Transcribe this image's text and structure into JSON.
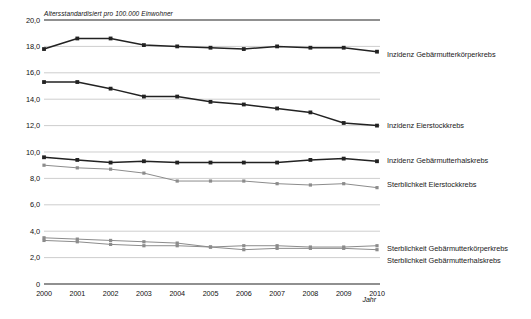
{
  "chart_data": {
    "type": "line",
    "title": "",
    "subtitle": "Altersstandardisiert pro 100.000 Einwohner",
    "xlabel": "Jahr",
    "ylabel": "",
    "x": [
      2000,
      2001,
      2002,
      2003,
      2004,
      2005,
      2006,
      2007,
      2008,
      2009,
      2010
    ],
    "categories": [
      "2000",
      "2001",
      "2002",
      "2003",
      "2004",
      "2005",
      "2006",
      "2007",
      "2008",
      "2009",
      "2010"
    ],
    "ylim": [
      0,
      20
    ],
    "yticks": [
      "0",
      "2,0",
      "4,0",
      "6,0",
      "8,0",
      "10,0",
      "12,0",
      "14,0",
      "16,0",
      "18,0",
      "20,0"
    ],
    "ytick_values": [
      0,
      2,
      4,
      6,
      8,
      10,
      12,
      14,
      16,
      18,
      20
    ],
    "grid": true,
    "legend_position": "right",
    "series": [
      {
        "name": "Inzidenz Gebärmutterkörperkrebs",
        "color": "#222222",
        "values": [
          17.8,
          18.6,
          18.6,
          18.1,
          18.0,
          17.9,
          17.8,
          18.0,
          17.9,
          17.9,
          17.6
        ]
      },
      {
        "name": "Inzidenz Eierstockkrebs",
        "color": "#222222",
        "values": [
          15.3,
          15.3,
          14.8,
          14.2,
          14.2,
          13.8,
          13.6,
          13.3,
          13.0,
          12.2,
          12.0
        ]
      },
      {
        "name": "Inzidenz Gebärmutterhalskrebs",
        "color": "#222222",
        "values": [
          9.6,
          9.4,
          9.2,
          9.3,
          9.2,
          9.2,
          9.2,
          9.2,
          9.4,
          9.5,
          9.3
        ]
      },
      {
        "name": "Sterblichkeit Eierstockkrebs",
        "color": "#8c8c8c",
        "values": [
          9.0,
          8.8,
          8.7,
          8.4,
          7.8,
          7.8,
          7.8,
          7.6,
          7.5,
          7.6,
          7.3
        ]
      },
      {
        "name": "Sterblichkeit Gebärmutterkörperkrebs",
        "color": "#8c8c8c",
        "values": [
          3.5,
          3.4,
          3.3,
          3.2,
          3.1,
          2.8,
          2.9,
          2.9,
          2.8,
          2.8,
          2.9
        ]
      },
      {
        "name": "Sterblichkeit Gebärmutterhalskrebs",
        "color": "#8c8c8c",
        "values": [
          3.3,
          3.2,
          3.0,
          2.9,
          2.9,
          2.8,
          2.6,
          2.7,
          2.7,
          2.7,
          2.6
        ]
      }
    ]
  },
  "axis": {
    "subtitle": "Altersstandardisiert pro 100.000 Einwohner",
    "x_title": "Jahr"
  },
  "legend": {
    "items": [
      {
        "label": "Inzidenz Gebärmutterkörperkrebs",
        "y": 57
      },
      {
        "label": "Inzidenz Eierstockkrebs",
        "y": 128
      },
      {
        "label": "Inzidenz Gebärmutterhalskrebs",
        "y": 163
      },
      {
        "label": "Sterblichkeit Eierstockkrebs",
        "y": 187
      },
      {
        "label": "Sterblichkeit Gebärmutterkörperkrebs",
        "y": 251
      },
      {
        "label": "Sterblichkeit Gebärmutterhalskrebs",
        "y": 263
      }
    ]
  }
}
